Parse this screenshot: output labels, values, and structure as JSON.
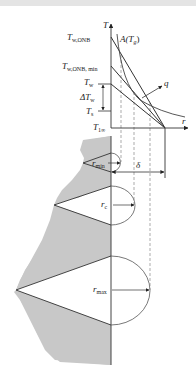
{
  "diagram": {
    "type": "nucleation-cavity-temperature-profile",
    "axes": {
      "y_axis_label": "T",
      "x_axis_label": "r"
    },
    "temperature_labels": [
      {
        "main": "T",
        "sub": "w,ONB"
      },
      {
        "main": "T",
        "sub": "w,ONB, min"
      },
      {
        "main": "T",
        "sub": "w"
      },
      {
        "main": "ΔT",
        "sub": "w"
      },
      {
        "main": "T",
        "sub": "s"
      },
      {
        "main": "T",
        "sub": "1∞"
      }
    ],
    "curve_labels": {
      "bubble_curve": "A(T",
      "bubble_curve_sub": "g",
      "bubble_curve_close": ")",
      "heat_flux": "q"
    },
    "cavity_labels": [
      {
        "main": "r",
        "sub": "min"
      },
      {
        "main": "r",
        "sub": "c"
      },
      {
        "main": "r",
        "sub": "max"
      }
    ],
    "thickness_label": "δ",
    "colors": {
      "wall_fill": "#c8c8c8",
      "line": "#333333",
      "dashed": "#888888",
      "topbar": "#e4e4e4"
    }
  }
}
